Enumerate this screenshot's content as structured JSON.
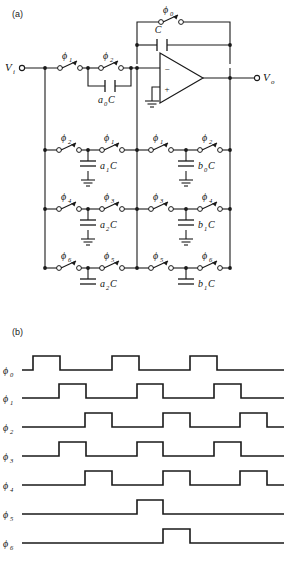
{
  "figure": {
    "panel_a": {
      "tag": "(a)",
      "caption": ""
    },
    "panel_b": {
      "tag": "(b)",
      "caption": ""
    }
  },
  "circuit": {
    "input_label": "V",
    "input_sub": "i",
    "output_label": "V",
    "output_sub": "o",
    "feedback_switch": {
      "phase": "ϕ",
      "sub": "0"
    },
    "feedback_cap": {
      "label": "C",
      "sub": ""
    },
    "opamp": {
      "minus": "−",
      "plus": "+"
    },
    "input_branch": {
      "left_switch": {
        "phase": "ϕ",
        "sub": "1"
      },
      "right_switch": {
        "phase": "ϕ",
        "sub": "2"
      },
      "cap": {
        "coef": "a",
        "coef_sub": "0",
        "unit": "C"
      }
    },
    "rows": [
      {
        "left_switch": {
          "phase": "ϕ",
          "sub": "2"
        },
        "mid_switch": {
          "phase": "ϕ",
          "sub": "1"
        },
        "left_cap": {
          "coef": "a",
          "coef_sub": "1",
          "unit": "C"
        },
        "right_switch": {
          "phase": "ϕ",
          "sub": "1"
        },
        "far_switch": {
          "phase": "ϕ",
          "sub": "2"
        },
        "right_cap": {
          "coef": "b",
          "coef_sub": "0",
          "unit": "C"
        }
      },
      {
        "left_switch": {
          "phase": "ϕ",
          "sub": "4"
        },
        "mid_switch": {
          "phase": "ϕ",
          "sub": "3"
        },
        "left_cap": {
          "coef": "a",
          "coef_sub": "2",
          "unit": "C"
        },
        "right_switch": {
          "phase": "ϕ",
          "sub": "3"
        },
        "far_switch": {
          "phase": "ϕ",
          "sub": "4"
        },
        "right_cap": {
          "coef": "b",
          "coef_sub": "1",
          "unit": "C"
        }
      },
      {
        "left_switch": {
          "phase": "ϕ",
          "sub": "6"
        },
        "mid_switch": {
          "phase": "ϕ",
          "sub": "5"
        },
        "left_cap": {
          "coef": "a",
          "coef_sub": "2",
          "unit": "C"
        },
        "right_switch": {
          "phase": "ϕ",
          "sub": "5"
        },
        "far_switch": {
          "phase": "ϕ",
          "sub": "6"
        },
        "right_cap": {
          "coef": "b",
          "coef_sub": "1",
          "unit": "C"
        }
      }
    ]
  },
  "chart_data": {
    "type": "line",
    "title": "",
    "xlabel": "",
    "ylabel": "",
    "grid": false,
    "legend": "left-row-labels",
    "x_range": [
      22,
      284
    ],
    "waveform_low_level": 0,
    "waveform_high_level": 1,
    "series": [
      {
        "name": "ϕ",
        "sub": "0",
        "pulses": [
          [
            33,
            60
          ],
          [
            112,
            139
          ],
          [
            190,
            217
          ]
        ]
      },
      {
        "name": "ϕ",
        "sub": "1",
        "pulses": [
          [
            59,
            86
          ],
          [
            137,
            163
          ],
          [
            214,
            241
          ]
        ]
      },
      {
        "name": "ϕ",
        "sub": "2",
        "pulses": [
          [
            85,
            112
          ],
          [
            163,
            190
          ],
          [
            240,
            267
          ]
        ]
      },
      {
        "name": "ϕ",
        "sub": "3",
        "pulses": [
          [
            59,
            86
          ],
          [
            137,
            163
          ],
          [
            214,
            241
          ]
        ]
      },
      {
        "name": "ϕ",
        "sub": "4",
        "pulses": [
          [
            85,
            112
          ],
          [
            163,
            190
          ],
          [
            240,
            267
          ]
        ]
      },
      {
        "name": "ϕ",
        "sub": "5",
        "pulses": [
          [
            137,
            163
          ]
        ]
      },
      {
        "name": "ϕ",
        "sub": "6",
        "pulses": [
          [
            163,
            190
          ]
        ]
      }
    ],
    "row_labels": [
      "ϕ0",
      "ϕ1",
      "ϕ2",
      "ϕ3",
      "ϕ4",
      "ϕ5",
      "ϕ6"
    ]
  },
  "style": {
    "stroke": "#1a1a1a",
    "text": "#111111",
    "background": "#ffffff"
  }
}
